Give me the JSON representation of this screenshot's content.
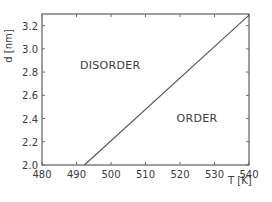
{
  "chart_data": {
    "type": "line",
    "title": "",
    "xlabel": "T [K]",
    "ylabel": "d [nm]",
    "xlim": [
      480,
      540
    ],
    "ylim": [
      2.0,
      3.3
    ],
    "xticks": [
      480,
      490,
      500,
      510,
      520,
      530,
      540
    ],
    "yticks": [
      2.0,
      2.2,
      2.4,
      2.6,
      2.8,
      3.0,
      3.2
    ],
    "xtick_labels": [
      "480",
      "490",
      "500",
      "510",
      "520",
      "530",
      "540"
    ],
    "ytick_labels": [
      "2.0",
      "2.2",
      "2.4",
      "2.6",
      "2.8",
      "3.0",
      "3.2"
    ],
    "grid": false,
    "series": [
      {
        "name": "order-disorder boundary",
        "x": [
          492.3,
          540
        ],
        "y": [
          2.0,
          3.29
        ]
      }
    ],
    "annotations": [
      {
        "text": "DISORDER",
        "x": 491,
        "y": 2.83
      },
      {
        "text": "ORDER",
        "x": 519,
        "y": 2.37
      }
    ]
  },
  "labels": {
    "x_axis": "T [K]",
    "y_axis": "d [nm]",
    "disorder": "DISORDER",
    "order": "ORDER"
  }
}
